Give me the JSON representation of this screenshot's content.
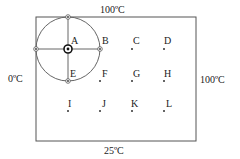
{
  "diagram": {
    "edges": {
      "top": "100ºC",
      "left": "0ºC",
      "right": "100ºC",
      "bottom": "25ºC"
    },
    "points": [
      {
        "id": "A",
        "label": "A"
      },
      {
        "id": "B",
        "label": "B"
      },
      {
        "id": "C",
        "label": "C"
      },
      {
        "id": "D",
        "label": "D"
      },
      {
        "id": "E",
        "label": "E"
      },
      {
        "id": "F",
        "label": "F"
      },
      {
        "id": "G",
        "label": "G"
      },
      {
        "id": "H",
        "label": "H"
      },
      {
        "id": "I",
        "label": "I"
      },
      {
        "id": "J",
        "label": "J"
      },
      {
        "id": "K",
        "label": "K"
      },
      {
        "id": "L",
        "label": "L"
      }
    ],
    "colors": {
      "line": "#555555",
      "text": "#222222"
    }
  }
}
